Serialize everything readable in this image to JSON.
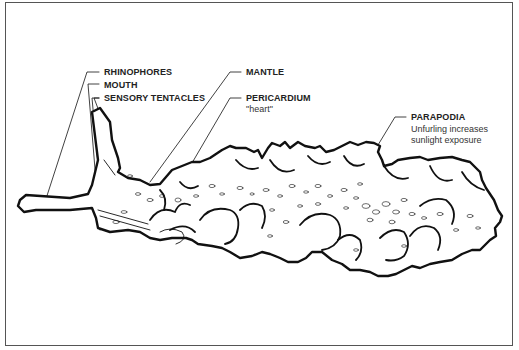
{
  "diagram": {
    "labels": [
      {
        "id": "rhinophores",
        "text": "RHINOPHORES"
      },
      {
        "id": "mouth",
        "text": "MOUTH"
      },
      {
        "id": "sensory_tentacles",
        "text": "SENSORY TENTACLES"
      },
      {
        "id": "mantle",
        "text": "MANTLE"
      },
      {
        "id": "pericardium",
        "text": "PERICARDIUM",
        "note": "\"heart\""
      },
      {
        "id": "parapodia",
        "text": "PARAPODIA",
        "note_lines": [
          "Unfurling increases",
          "sunlight exposure"
        ]
      }
    ],
    "colors": {
      "line": "#111111",
      "background": "#ffffff",
      "frame": "#555555"
    }
  }
}
